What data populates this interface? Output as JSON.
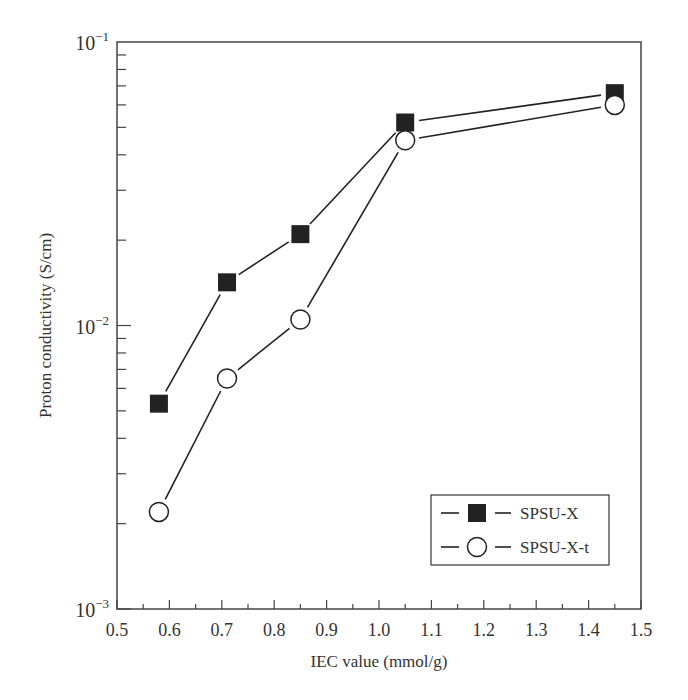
{
  "chart_data": {
    "type": "line",
    "title": "",
    "xlabel": "IEC value (mmol/g)",
    "ylabel": "Proton conductivity (S/cm)",
    "xlim": [
      0.5,
      1.5
    ],
    "ylim": [
      0.001,
      0.1
    ],
    "yscale": "log",
    "grid": false,
    "legend_position": "lower right",
    "x_ticks": [
      "0.5",
      "0.6",
      "0.7",
      "0.8",
      "0.9",
      "1.0",
      "1.1",
      "1.2",
      "1.3",
      "1.4",
      "1.5"
    ],
    "y_ticks": [
      {
        "base": "10",
        "exp": "−1",
        "value": 0.1
      },
      {
        "base": "10",
        "exp": "−2",
        "value": 0.01
      },
      {
        "base": "10",
        "exp": "−3",
        "value": 0.001
      }
    ],
    "x": [
      0.58,
      0.71,
      0.85,
      1.05,
      1.45
    ],
    "series": [
      {
        "name": "SPSU-X",
        "marker": "filled-square",
        "values": [
          0.0053,
          0.0142,
          0.021,
          0.052,
          0.066
        ]
      },
      {
        "name": "SPSU-X-t",
        "marker": "open-circle",
        "values": [
          0.0022,
          0.0065,
          0.0105,
          0.045,
          0.06
        ]
      }
    ]
  }
}
